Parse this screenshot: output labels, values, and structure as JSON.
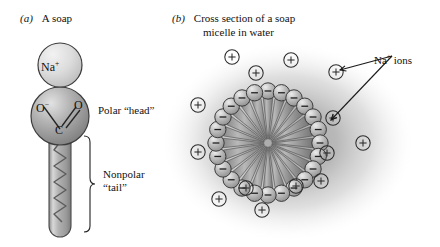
{
  "figure": {
    "title_a_index": "(a)",
    "title_a_text": "A soap",
    "title_b_index": "(b)",
    "title_b_text_line1": "Cross section of a soap",
    "title_b_text_line2": "micelle in water"
  },
  "panel_a": {
    "cation_label": "Na",
    "cation_charge": "+",
    "atom_o_left": "O",
    "atom_o_left_charge": "−",
    "atom_c": "C",
    "atom_o_right": "O",
    "head_label": "Polar “head”",
    "tail_label_line1": "Nonpolar",
    "tail_label_line2": "“tail”",
    "head_charge_sign": "−"
  },
  "panel_b": {
    "ion_label": "Na",
    "ion_label_charge": "+",
    "ion_label_suffix": " ions",
    "head_sign": "−",
    "ion_sign": "+",
    "micelle_head_count": 24,
    "micelle_tail_count": 24,
    "free_ion_positions": [
      {
        "x": 232,
        "y": 57
      },
      {
        "x": 291,
        "y": 60
      },
      {
        "x": 256,
        "y": 73
      },
      {
        "x": 336,
        "y": 72
      },
      {
        "x": 198,
        "y": 105
      },
      {
        "x": 333,
        "y": 118
      },
      {
        "x": 198,
        "y": 152
      },
      {
        "x": 363,
        "y": 143
      },
      {
        "x": 327,
        "y": 153
      },
      {
        "x": 296,
        "y": 186
      },
      {
        "x": 321,
        "y": 181
      },
      {
        "x": 246,
        "y": 188
      },
      {
        "x": 219,
        "y": 199
      },
      {
        "x": 262,
        "y": 210
      }
    ],
    "arrow_targets": [
      {
        "x": 340,
        "y": 70
      },
      {
        "x": 331,
        "y": 120
      }
    ]
  },
  "colors": {
    "sphere_fill": "#9a9a9a",
    "sphere_stroke": "#3a3a3a",
    "cation_fill": "#d6d6d6",
    "water_fill": "#b5b5b5",
    "tail_fill": "#9c9c9c",
    "ink": "#1a1a1a"
  }
}
